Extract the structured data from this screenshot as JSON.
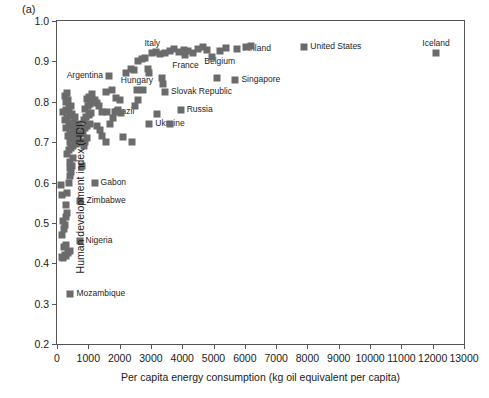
{
  "figure": {
    "panel_letter": "(a)"
  },
  "chart_data": {
    "type": "scatter",
    "title": "",
    "xlabel": "Per capita energy consumption (kg oil equivalent per capita)",
    "ylabel": "Human development index (HDI)",
    "xlim": [
      0,
      13000
    ],
    "ylim": [
      0.2,
      1.0
    ],
    "xticks": [
      0,
      1000,
      2000,
      3000,
      4000,
      5000,
      6000,
      7000,
      8000,
      9000,
      10000,
      11000,
      12000,
      13000
    ],
    "xtick_labels": [
      "0",
      "1000",
      "2000",
      "3000",
      "4000",
      "5000",
      "6000",
      "7000",
      "8000",
      "9000",
      "10000",
      "11000",
      "12000",
      "13000"
    ],
    "yticks": [
      0.2,
      0.3,
      0.4,
      0.5,
      0.6,
      0.7,
      0.8,
      0.9,
      1.0
    ],
    "ytick_labels": [
      "0.2",
      "0.3",
      "0.4",
      "0.5",
      "0.6",
      "0.7",
      "0.8",
      "0.9",
      "1.0"
    ],
    "grid": false,
    "legend": "none",
    "marker_color": "#6b6b6b",
    "marker_shape": "square",
    "points": [
      {
        "x": 12100,
        "y": 0.92,
        "label": "Iceland",
        "label_pos": "above"
      },
      {
        "x": 7900,
        "y": 0.935,
        "label": "United States",
        "label_pos": "right"
      },
      {
        "x": 5750,
        "y": 0.93,
        "label": "Finland",
        "label_pos": "right"
      },
      {
        "x": 5700,
        "y": 0.855,
        "label": "Singapore",
        "label_pos": "right"
      },
      {
        "x": 5200,
        "y": 0.925,
        "label": "Belgium",
        "label_pos": "below"
      },
      {
        "x": 4100,
        "y": 0.915,
        "label": "France",
        "label_pos": "below"
      },
      {
        "x": 3050,
        "y": 0.92,
        "label": "Italy",
        "label_pos": "above"
      },
      {
        "x": 3950,
        "y": 0.78,
        "label": "Russia",
        "label_pos": "right"
      },
      {
        "x": 3450,
        "y": 0.825,
        "label": "Slovak Republic",
        "label_pos": "right"
      },
      {
        "x": 2550,
        "y": 0.83,
        "label": "Hungary",
        "label_pos": "above"
      },
      {
        "x": 2950,
        "y": 0.745,
        "label": "Ukraine",
        "label_pos": "right"
      },
      {
        "x": 1600,
        "y": 0.775,
        "label": "Brazil",
        "label_pos": "right"
      },
      {
        "x": 1650,
        "y": 0.865,
        "label": "Argentina",
        "label_pos": "left"
      },
      {
        "x": 1200,
        "y": 0.6,
        "label": "Gabon",
        "label_pos": "right"
      },
      {
        "x": 750,
        "y": 0.555,
        "label": "Zimbabwe",
        "label_pos": "right"
      },
      {
        "x": 720,
        "y": 0.455,
        "label": "Nigeria",
        "label_pos": "right"
      },
      {
        "x": 430,
        "y": 0.325,
        "label": "Mozambique",
        "label_pos": "right"
      },
      {
        "x": 150,
        "y": 0.415,
        "label": ""
      },
      {
        "x": 200,
        "y": 0.412,
        "label": ""
      },
      {
        "x": 250,
        "y": 0.42,
        "label": ""
      },
      {
        "x": 300,
        "y": 0.418,
        "label": ""
      },
      {
        "x": 350,
        "y": 0.425,
        "label": ""
      },
      {
        "x": 400,
        "y": 0.43,
        "label": ""
      },
      {
        "x": 230,
        "y": 0.44,
        "label": ""
      },
      {
        "x": 300,
        "y": 0.445,
        "label": ""
      },
      {
        "x": 170,
        "y": 0.47,
        "label": ""
      },
      {
        "x": 230,
        "y": 0.485,
        "label": ""
      },
      {
        "x": 260,
        "y": 0.495,
        "label": ""
      },
      {
        "x": 200,
        "y": 0.505,
        "label": ""
      },
      {
        "x": 290,
        "y": 0.515,
        "label": ""
      },
      {
        "x": 320,
        "y": 0.525,
        "label": ""
      },
      {
        "x": 280,
        "y": 0.545,
        "label": ""
      },
      {
        "x": 160,
        "y": 0.57,
        "label": ""
      },
      {
        "x": 330,
        "y": 0.575,
        "label": ""
      },
      {
        "x": 120,
        "y": 0.595,
        "label": ""
      },
      {
        "x": 380,
        "y": 0.6,
        "label": ""
      },
      {
        "x": 420,
        "y": 0.615,
        "label": ""
      },
      {
        "x": 440,
        "y": 0.625,
        "label": ""
      },
      {
        "x": 400,
        "y": 0.635,
        "label": ""
      },
      {
        "x": 470,
        "y": 0.64,
        "label": ""
      },
      {
        "x": 430,
        "y": 0.65,
        "label": ""
      },
      {
        "x": 520,
        "y": 0.66,
        "label": ""
      },
      {
        "x": 330,
        "y": 0.67,
        "label": ""
      },
      {
        "x": 380,
        "y": 0.68,
        "label": ""
      },
      {
        "x": 460,
        "y": 0.685,
        "label": ""
      },
      {
        "x": 520,
        "y": 0.69,
        "label": ""
      },
      {
        "x": 600,
        "y": 0.695,
        "label": ""
      },
      {
        "x": 660,
        "y": 0.698,
        "label": ""
      },
      {
        "x": 410,
        "y": 0.7,
        "label": ""
      },
      {
        "x": 480,
        "y": 0.705,
        "label": ""
      },
      {
        "x": 550,
        "y": 0.71,
        "label": ""
      },
      {
        "x": 620,
        "y": 0.705,
        "label": ""
      },
      {
        "x": 700,
        "y": 0.712,
        "label": ""
      },
      {
        "x": 760,
        "y": 0.7,
        "label": ""
      },
      {
        "x": 350,
        "y": 0.715,
        "label": ""
      },
      {
        "x": 430,
        "y": 0.72,
        "label": ""
      },
      {
        "x": 500,
        "y": 0.725,
        "label": ""
      },
      {
        "x": 580,
        "y": 0.73,
        "label": ""
      },
      {
        "x": 650,
        "y": 0.722,
        "label": ""
      },
      {
        "x": 300,
        "y": 0.735,
        "label": ""
      },
      {
        "x": 380,
        "y": 0.74,
        "label": ""
      },
      {
        "x": 450,
        "y": 0.745,
        "label": ""
      },
      {
        "x": 530,
        "y": 0.748,
        "label": ""
      },
      {
        "x": 610,
        "y": 0.74,
        "label": ""
      },
      {
        "x": 700,
        "y": 0.745,
        "label": ""
      },
      {
        "x": 250,
        "y": 0.755,
        "label": ""
      },
      {
        "x": 330,
        "y": 0.76,
        "label": ""
      },
      {
        "x": 420,
        "y": 0.765,
        "label": ""
      },
      {
        "x": 490,
        "y": 0.77,
        "label": ""
      },
      {
        "x": 570,
        "y": 0.762,
        "label": ""
      },
      {
        "x": 200,
        "y": 0.775,
        "label": ""
      },
      {
        "x": 300,
        "y": 0.78,
        "label": ""
      },
      {
        "x": 380,
        "y": 0.785,
        "label": ""
      },
      {
        "x": 460,
        "y": 0.79,
        "label": ""
      },
      {
        "x": 280,
        "y": 0.8,
        "label": ""
      },
      {
        "x": 350,
        "y": 0.805,
        "label": ""
      },
      {
        "x": 240,
        "y": 0.815,
        "label": ""
      },
      {
        "x": 330,
        "y": 0.822,
        "label": ""
      },
      {
        "x": 800,
        "y": 0.64,
        "label": ""
      },
      {
        "x": 870,
        "y": 0.69,
        "label": ""
      },
      {
        "x": 900,
        "y": 0.7,
        "label": ""
      },
      {
        "x": 950,
        "y": 0.71,
        "label": ""
      },
      {
        "x": 820,
        "y": 0.725,
        "label": ""
      },
      {
        "x": 880,
        "y": 0.735,
        "label": ""
      },
      {
        "x": 960,
        "y": 0.74,
        "label": ""
      },
      {
        "x": 1040,
        "y": 0.745,
        "label": ""
      },
      {
        "x": 850,
        "y": 0.755,
        "label": ""
      },
      {
        "x": 930,
        "y": 0.762,
        "label": ""
      },
      {
        "x": 1010,
        "y": 0.768,
        "label": ""
      },
      {
        "x": 1100,
        "y": 0.772,
        "label": ""
      },
      {
        "x": 900,
        "y": 0.782,
        "label": ""
      },
      {
        "x": 980,
        "y": 0.79,
        "label": ""
      },
      {
        "x": 1060,
        "y": 0.795,
        "label": ""
      },
      {
        "x": 1140,
        "y": 0.8,
        "label": ""
      },
      {
        "x": 950,
        "y": 0.808,
        "label": ""
      },
      {
        "x": 1030,
        "y": 0.812,
        "label": ""
      },
      {
        "x": 1120,
        "y": 0.818,
        "label": ""
      },
      {
        "x": 1200,
        "y": 0.805,
        "label": ""
      },
      {
        "x": 1280,
        "y": 0.798,
        "label": ""
      },
      {
        "x": 1350,
        "y": 0.79,
        "label": ""
      },
      {
        "x": 1430,
        "y": 0.775,
        "label": ""
      },
      {
        "x": 1280,
        "y": 0.74,
        "label": ""
      },
      {
        "x": 1380,
        "y": 0.73,
        "label": ""
      },
      {
        "x": 1450,
        "y": 0.715,
        "label": ""
      },
      {
        "x": 1550,
        "y": 0.7,
        "label": ""
      },
      {
        "x": 1700,
        "y": 0.745,
        "label": ""
      },
      {
        "x": 1780,
        "y": 0.76,
        "label": ""
      },
      {
        "x": 1850,
        "y": 0.775,
        "label": ""
      },
      {
        "x": 1950,
        "y": 0.78,
        "label": ""
      },
      {
        "x": 2050,
        "y": 0.772,
        "label": ""
      },
      {
        "x": 1900,
        "y": 0.81,
        "label": ""
      },
      {
        "x": 2000,
        "y": 0.805,
        "label": ""
      },
      {
        "x": 1750,
        "y": 0.83,
        "label": ""
      },
      {
        "x": 1550,
        "y": 0.825,
        "label": ""
      },
      {
        "x": 2200,
        "y": 0.87,
        "label": ""
      },
      {
        "x": 2350,
        "y": 0.88,
        "label": ""
      },
      {
        "x": 2450,
        "y": 0.878,
        "label": ""
      },
      {
        "x": 2600,
        "y": 0.9,
        "label": ""
      },
      {
        "x": 2700,
        "y": 0.905,
        "label": ""
      },
      {
        "x": 2800,
        "y": 0.908,
        "label": ""
      },
      {
        "x": 2900,
        "y": 0.88,
        "label": ""
      },
      {
        "x": 2950,
        "y": 0.87,
        "label": ""
      },
      {
        "x": 3150,
        "y": 0.922,
        "label": ""
      },
      {
        "x": 3300,
        "y": 0.918,
        "label": ""
      },
      {
        "x": 3450,
        "y": 0.92,
        "label": ""
      },
      {
        "x": 3600,
        "y": 0.925,
        "label": ""
      },
      {
        "x": 3750,
        "y": 0.93,
        "label": ""
      },
      {
        "x": 3900,
        "y": 0.922,
        "label": ""
      },
      {
        "x": 4050,
        "y": 0.928,
        "label": ""
      },
      {
        "x": 4200,
        "y": 0.925,
        "label": ""
      },
      {
        "x": 4350,
        "y": 0.92,
        "label": ""
      },
      {
        "x": 4500,
        "y": 0.93,
        "label": ""
      },
      {
        "x": 4650,
        "y": 0.935,
        "label": ""
      },
      {
        "x": 4800,
        "y": 0.928,
        "label": ""
      },
      {
        "x": 4950,
        "y": 0.91,
        "label": ""
      },
      {
        "x": 5400,
        "y": 0.932,
        "label": ""
      },
      {
        "x": 6050,
        "y": 0.935,
        "label": ""
      },
      {
        "x": 6200,
        "y": 0.938,
        "label": ""
      },
      {
        "x": 5100,
        "y": 0.86,
        "label": ""
      },
      {
        "x": 3350,
        "y": 0.86,
        "label": ""
      },
      {
        "x": 3400,
        "y": 0.845,
        "label": ""
      },
      {
        "x": 2750,
        "y": 0.83,
        "label": ""
      },
      {
        "x": 2600,
        "y": 0.805,
        "label": ""
      },
      {
        "x": 2500,
        "y": 0.79,
        "label": ""
      },
      {
        "x": 3200,
        "y": 0.77,
        "label": ""
      },
      {
        "x": 3600,
        "y": 0.745,
        "label": ""
      },
      {
        "x": 2400,
        "y": 0.7,
        "label": ""
      },
      {
        "x": 2100,
        "y": 0.712,
        "label": ""
      }
    ]
  }
}
